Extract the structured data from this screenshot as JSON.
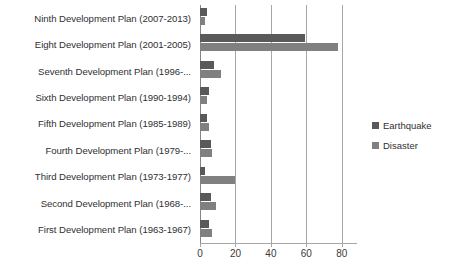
{
  "chart_data": {
    "type": "bar",
    "orientation": "horizontal",
    "title": "",
    "xlabel": "",
    "ylabel": "",
    "xlim": [
      0,
      88
    ],
    "xticks": [
      0,
      20,
      40,
      60,
      80
    ],
    "xtick_labels": [
      "0",
      "20",
      "40",
      "60",
      "80"
    ],
    "grid": true,
    "legend_position": "right",
    "categories": [
      "Ninth Development Plan (2007-2013)",
      "Eight Development Plan (2001-2005)",
      "Seventh Development Plan (1996-...",
      "Sixth Development Plan (1990-1994)",
      "Fifth Development Plan (1985-1989)",
      "Fourth Development Plan (1979-...",
      "Third Development Plan (1973-1977)",
      "Second Development Plan (1968-...",
      "First Development Plan (1963-1967)"
    ],
    "series": [
      {
        "name": "Earthquake",
        "color": "#595959",
        "values": [
          4,
          59,
          8,
          5,
          4,
          6,
          3,
          6,
          5
        ]
      },
      {
        "name": "Disaster",
        "color": "#808080",
        "values": [
          3,
          78,
          12,
          4,
          5,
          7,
          20,
          9,
          7
        ]
      }
    ]
  },
  "legend": {
    "items": [
      {
        "label": "Earthquake",
        "color": "#595959"
      },
      {
        "label": "Disaster",
        "color": "#808080"
      }
    ]
  }
}
